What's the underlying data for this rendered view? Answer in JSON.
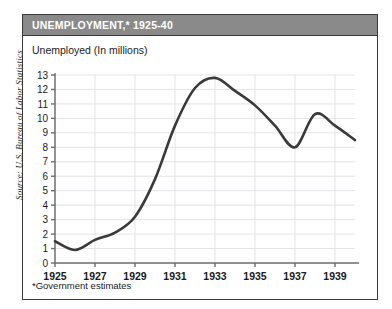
{
  "source_credit": "Source: U.S. Bureau of Labor Statistics",
  "card": {
    "title": "UNEMPLOYMENT,* 1925-40",
    "axis_title": "Unemployed (In millions)",
    "footnote": "*Government estimates"
  },
  "colors": {
    "title_bar": "#8a8a8a",
    "title_text": "#ffffff",
    "line": "#3a3a3a",
    "grid": "#e3e3e8",
    "axis": "#6b6b6b",
    "card_border": "#3a3a3a",
    "background": "#ffffff"
  },
  "chart_data": {
    "type": "line",
    "title": "UNEMPLOYMENT,* 1925-40",
    "xlabel": "",
    "ylabel": "Unemployed (In millions)",
    "xlim": [
      1925,
      1940
    ],
    "ylim": [
      0,
      13
    ],
    "grid": true,
    "legend": null,
    "y_ticks": [
      0,
      1,
      2,
      3,
      4,
      5,
      6,
      7,
      8,
      9,
      10,
      11,
      12,
      13
    ],
    "y_tick_labels": [
      "0",
      "1",
      "2",
      "3",
      "4",
      "5",
      "6",
      "7",
      "8",
      "9",
      "10",
      "11",
      "12",
      "13"
    ],
    "x_ticks": [
      1925,
      1927,
      1929,
      1931,
      1933,
      1935,
      1937,
      1939
    ],
    "x_tick_labels": [
      "1925",
      "1927",
      "1929",
      "1931",
      "1933",
      "1935",
      "1937",
      "1939"
    ],
    "annotations": [
      "*Government estimates"
    ],
    "x": [
      1925,
      1926,
      1927,
      1928,
      1929,
      1930,
      1931,
      1932,
      1933,
      1934,
      1935,
      1936,
      1937,
      1938,
      1939,
      1940
    ],
    "values": [
      1.5,
      0.9,
      1.6,
      2.1,
      3.2,
      5.8,
      9.5,
      12.1,
      12.8,
      11.9,
      10.9,
      9.5,
      8.0,
      10.3,
      9.5,
      8.5
    ],
    "series": [
      {
        "name": "Unemployed (In millions)",
        "values": [
          1.5,
          0.9,
          1.6,
          2.1,
          3.2,
          5.8,
          9.5,
          12.1,
          12.8,
          11.9,
          10.9,
          9.5,
          8.0,
          10.3,
          9.5,
          8.5
        ]
      }
    ]
  }
}
